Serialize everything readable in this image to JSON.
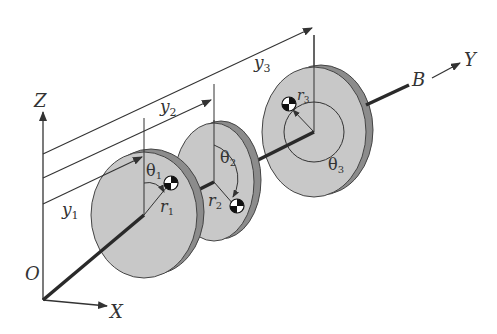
{
  "figure": {
    "axes": {
      "origin": "O",
      "x": "X",
      "y": "Y",
      "z": "Z",
      "end_point": "B"
    },
    "disks": [
      {
        "id": 1,
        "position_label": "y1",
        "pos_main": "y",
        "pos_sub": "1",
        "radius_label": "r1",
        "r_main": "r",
        "r_sub": "1",
        "angle_label": "θ1",
        "a_main": "θ",
        "a_sub": "1"
      },
      {
        "id": 2,
        "position_label": "y2",
        "pos_main": "y",
        "pos_sub": "2",
        "radius_label": "r2",
        "r_main": "r",
        "r_sub": "2",
        "angle_label": "θ2",
        "a_main": "θ",
        "a_sub": "2"
      },
      {
        "id": 3,
        "position_label": "y3",
        "pos_main": "y",
        "pos_sub": "3",
        "radius_label": "r3",
        "r_main": "r",
        "r_sub": "3",
        "angle_label": "θ3",
        "a_main": "θ",
        "a_sub": "3"
      }
    ],
    "colors": {
      "disk_face": "#c8c8c8",
      "disk_rim": "#8c8c8c",
      "line": "#333333",
      "shaft": "#2a2a2a"
    }
  }
}
